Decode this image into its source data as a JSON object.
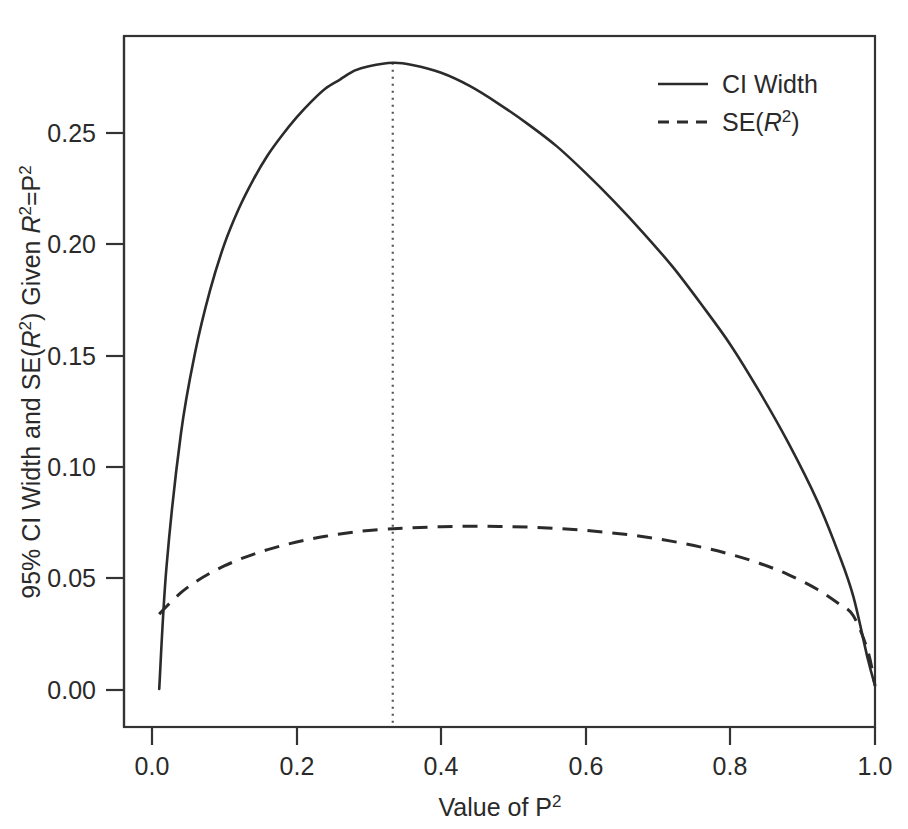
{
  "chart_data": {
    "type": "line",
    "title": "",
    "xlabel": "Value of P²",
    "ylabel": "95% CI Width and SE(R²) Given R²=P²",
    "xlim": [
      0.0,
      1.0
    ],
    "ylim": [
      0.0,
      0.29
    ],
    "grid": false,
    "legend_position": "top-right",
    "xticks": [
      "0.0",
      "0.2",
      "0.4",
      "0.6",
      "0.8",
      "1.0"
    ],
    "xtick_values": [
      0.0,
      0.2,
      0.4,
      0.6,
      0.8,
      1.0
    ],
    "yticks": [
      "0.00",
      "0.05",
      "0.10",
      "0.15",
      "0.20",
      "0.25"
    ],
    "ytick_values": [
      0.0,
      0.05,
      0.1,
      0.15,
      0.2,
      0.25
    ],
    "annotations": [
      {
        "name": "peak-reference-line",
        "type": "vertical-dotted-line",
        "x": 0.333,
        "label": ""
      }
    ],
    "x": [
      0.01,
      0.02,
      0.04,
      0.06,
      0.08,
      0.1,
      0.12,
      0.14,
      0.16,
      0.18,
      0.2,
      0.22,
      0.24,
      0.26,
      0.28,
      0.3,
      0.3333,
      0.36,
      0.4,
      0.44,
      0.48,
      0.52,
      0.56,
      0.6,
      0.64,
      0.68,
      0.72,
      0.76,
      0.8,
      0.84,
      0.88,
      0.92,
      0.95,
      0.97,
      0.99,
      1.0
    ],
    "series": [
      {
        "name": "CI Width",
        "style": "solid",
        "values": [
          0.0005,
          0.055,
          0.115,
          0.152,
          0.179,
          0.2,
          0.216,
          0.229,
          0.24,
          0.249,
          0.257,
          0.264,
          0.27,
          0.274,
          0.278,
          0.28,
          0.2815,
          0.2805,
          0.277,
          0.271,
          0.263,
          0.254,
          0.244,
          0.232,
          0.219,
          0.205,
          0.19,
          0.173,
          0.155,
          0.134,
          0.111,
          0.085,
          0.061,
          0.042,
          0.014,
          0.002
        ]
      },
      {
        "name": "SE(R²)",
        "style": "dashed",
        "values": [
          0.034,
          0.0375,
          0.0437,
          0.0485,
          0.0524,
          0.0557,
          0.0585,
          0.0609,
          0.063,
          0.0648,
          0.0664,
          0.0678,
          0.069,
          0.07,
          0.0709,
          0.0716,
          0.0724,
          0.0728,
          0.0733,
          0.0735,
          0.0734,
          0.0731,
          0.0725,
          0.0716,
          0.0704,
          0.0688,
          0.0667,
          0.0641,
          0.0609,
          0.0569,
          0.0518,
          0.0452,
          0.0387,
          0.0333,
          0.0177,
          0.002
        ]
      }
    ]
  },
  "legend": {
    "entries": [
      {
        "label": "CI Width",
        "style": "solid"
      },
      {
        "label": "SE(R2)",
        "style": "dashed"
      }
    ]
  },
  "labels": {
    "y_axis_parts": {
      "prefix": "95% CI Width and SE(",
      "italic_r": "R",
      "sup_2_a": "2",
      "mid": ") Given ",
      "italic_r2": "R",
      "sup_2_b": "2",
      "eq": "=P",
      "sup_2_c": "2"
    },
    "x_axis_parts": {
      "prefix": "Value of P",
      "sup_2": "2"
    },
    "legend_se_parts": {
      "prefix": "SE(",
      "italic_r": "R",
      "sup_2": "2",
      "suffix": ")"
    }
  }
}
